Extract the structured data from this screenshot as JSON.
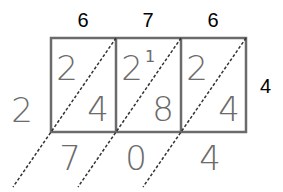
{
  "diagram": {
    "type": "lattice-multiplication",
    "top_digits": [
      "6",
      "7",
      "6"
    ],
    "right_digit": "4",
    "left_result_digit": "2",
    "cells": [
      {
        "tens": "2",
        "ones": "4",
        "carry": ""
      },
      {
        "tens": "2",
        "ones": "8",
        "carry": "1"
      },
      {
        "tens": "2",
        "ones": "4",
        "carry": ""
      }
    ],
    "bottom_result_digits": [
      "7",
      "0",
      "4"
    ],
    "colors": {
      "grid": "#6b6b6b",
      "handwritten": "#6b6b6b",
      "header": "#000000",
      "diagonal": "#333333"
    }
  }
}
